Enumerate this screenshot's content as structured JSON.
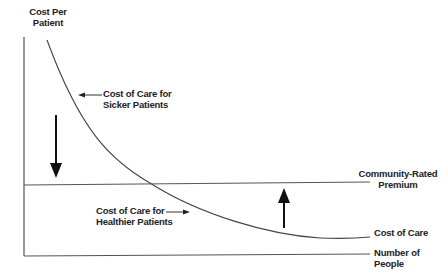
{
  "diagram": {
    "y_axis_label_line1": "Cost Per",
    "y_axis_label_line2": "Patient",
    "x_axis_label_line1": "Number of",
    "x_axis_label_line2": "People",
    "premium_label_line1": "Community-Rated",
    "premium_label_line2": "Premium",
    "curve_label": "Cost of Care",
    "sicker_label_line1": "Cost of Care for",
    "sicker_label_line2": "Sicker Patients",
    "healthier_label_line1": "Cost of Care for",
    "healthier_label_line2": "Healthier Patients",
    "arrows": [
      {
        "name": "down-arrow",
        "direction": "down",
        "meaning": "premium lower than cost for sicker patients"
      },
      {
        "name": "up-arrow",
        "direction": "up",
        "meaning": "premium higher than cost for healthier patients"
      }
    ],
    "colors": {
      "line": "#444444",
      "text": "#222222",
      "background": "#ffffff"
    }
  }
}
